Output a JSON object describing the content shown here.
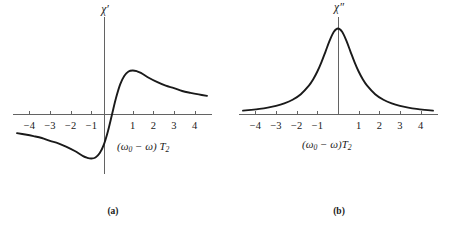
{
  "figure": {
    "background": "#ffffff",
    "curve_color": "#1a1a1a",
    "axis_color": "#636363"
  },
  "panels": [
    {
      "id": "a",
      "caption": "(a)",
      "ylabel": "χ′",
      "xlabel_prefix": "(ω",
      "xlabel_sub": "0",
      "xlabel_mid": " − ω) ",
      "xlabel_T": "T",
      "xlabel_Tsub": "2",
      "tick_labels": [
        "−4",
        "−3",
        "−2",
        "−1",
        "1",
        "2",
        "3",
        "4"
      ]
    },
    {
      "id": "b",
      "caption": "(b)",
      "ylabel": "χ″",
      "xlabel_prefix": "(ω",
      "xlabel_sub": "0",
      "xlabel_mid": " − ω)",
      "xlabel_T": "T",
      "xlabel_Tsub": "2",
      "tick_labels": [
        "−4",
        "−3",
        "−2",
        "−1",
        "1",
        "2",
        "3",
        "4"
      ]
    }
  ],
  "chart_data": [
    {
      "type": "line",
      "title": "(a)",
      "xlabel": "(ω₀ − ω) T₂",
      "ylabel": "χ′",
      "function": "dispersion",
      "formula": "x / (1 + x^2)",
      "xlim": [
        -4.6,
        4.6
      ],
      "ylim": [
        -0.5,
        0.5
      ],
      "grid": false,
      "legend": "none",
      "xticks": [
        -4,
        -3,
        -2,
        -1,
        1,
        2,
        3,
        4
      ],
      "yticks": [],
      "x": [
        -4.6,
        -4.2,
        -3.8,
        -3.4,
        -3.0,
        -2.6,
        -2.2,
        -1.8,
        -1.4,
        -1.2,
        -1.0,
        -0.8,
        -0.6,
        -0.4,
        -0.2,
        0.0,
        0.2,
        0.4,
        0.6,
        0.8,
        1.0,
        1.2,
        1.4,
        1.8,
        2.2,
        2.6,
        3.0,
        3.4,
        3.8,
        4.2,
        4.6
      ],
      "y": [
        -0.212,
        -0.228,
        -0.246,
        -0.267,
        -0.3,
        -0.327,
        -0.367,
        -0.415,
        -0.473,
        -0.492,
        -0.5,
        -0.488,
        -0.441,
        -0.345,
        -0.192,
        0.0,
        0.192,
        0.345,
        0.441,
        0.488,
        0.5,
        0.492,
        0.473,
        0.415,
        0.367,
        0.327,
        0.3,
        0.267,
        0.246,
        0.228,
        0.212
      ],
      "annotations": [
        "zero crossing at x = 0",
        "maximum near x = +1",
        "minimum near x = -1"
      ]
    },
    {
      "type": "line",
      "title": "(b)",
      "xlabel": "(ω₀ − ω)T₂",
      "ylabel": "χ″",
      "function": "absorption",
      "formula": "1 / (1 + x^2)",
      "xlim": [
        -4.6,
        4.6
      ],
      "ylim": [
        0,
        1
      ],
      "grid": false,
      "legend": "none",
      "xticks": [
        -4,
        -3,
        -2,
        -1,
        1,
        2,
        3,
        4
      ],
      "yticks": [],
      "x": [
        -4.6,
        -4.2,
        -3.8,
        -3.4,
        -3.0,
        -2.6,
        -2.2,
        -1.8,
        -1.4,
        -1.2,
        -1.0,
        -0.8,
        -0.6,
        -0.4,
        -0.2,
        0.0,
        0.2,
        0.4,
        0.6,
        0.8,
        1.0,
        1.2,
        1.4,
        1.8,
        2.2,
        2.6,
        3.0,
        3.4,
        3.8,
        4.2,
        4.6
      ],
      "y": [
        0.045,
        0.054,
        0.065,
        0.08,
        0.1,
        0.129,
        0.171,
        0.236,
        0.338,
        0.41,
        0.5,
        0.61,
        0.735,
        0.862,
        0.962,
        1.0,
        0.962,
        0.862,
        0.735,
        0.61,
        0.5,
        0.41,
        0.338,
        0.236,
        0.171,
        0.129,
        0.1,
        0.08,
        0.065,
        0.054,
        0.045
      ],
      "annotations": [
        "peak at x = 0",
        "half maximum at x = ±1"
      ]
    }
  ]
}
